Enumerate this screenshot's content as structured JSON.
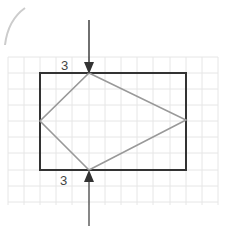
{
  "diagram": {
    "top_label": "3",
    "bottom_label": "3",
    "colors": {
      "grid": "#e6e6e6",
      "rectangle": "#333333",
      "kite": "#999999",
      "arrow": "#333333",
      "arc": "#cccccc"
    }
  }
}
